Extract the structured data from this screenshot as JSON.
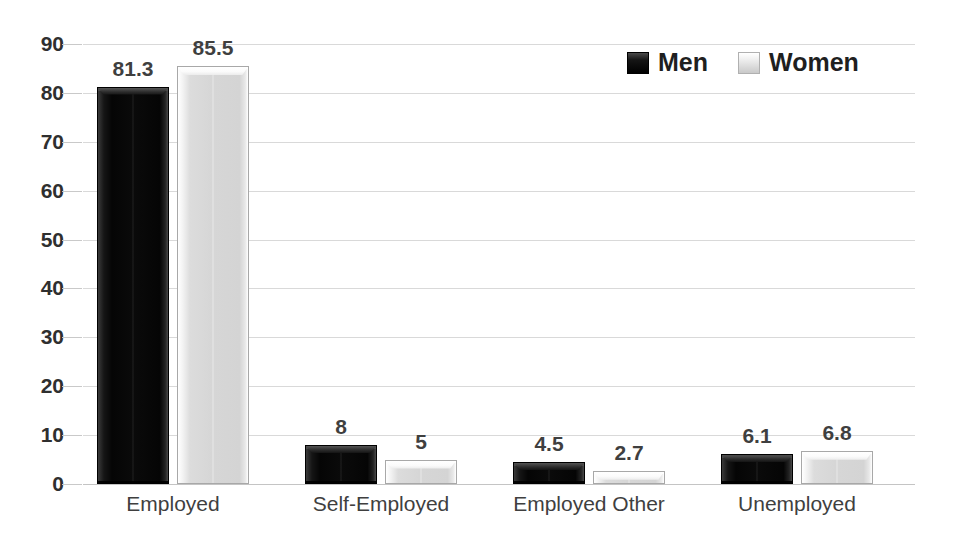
{
  "chart_data": {
    "type": "bar",
    "title": "",
    "subtitle": "",
    "xlabel": "",
    "ylabel": "",
    "categories": [
      "Employed",
      "Self-Employed",
      "Employed Other",
      "Unemployed"
    ],
    "series": [
      {
        "name": "Men",
        "color": "#000000",
        "values": [
          81.3,
          8,
          4.5,
          6.1
        ],
        "labels": [
          "81.3",
          "8",
          "4.5",
          "6.1"
        ]
      },
      {
        "name": "Women",
        "color": "#d9d9d9",
        "values": [
          85.5,
          5,
          2.7,
          6.8
        ],
        "labels": [
          "85.5",
          "5",
          "2.7",
          "6.8"
        ]
      }
    ],
    "ylim": [
      0,
      90
    ],
    "ytick_values": [
      0,
      10,
      20,
      30,
      40,
      50,
      60,
      70,
      80,
      90
    ],
    "ytick_labels": [
      "0",
      "10",
      "20",
      "30",
      "40",
      "50",
      "60",
      "70",
      "80",
      "90"
    ],
    "grid": true,
    "grid_axis": "y",
    "legend_position": "top-right",
    "data_labels_shown": true
  },
  "legend": {
    "entries": [
      {
        "label": "Men",
        "swatch": "men-legend-swatch"
      },
      {
        "label": "Women",
        "swatch": "women-legend-swatch"
      }
    ]
  },
  "colors": {
    "men_bar": "#0a0a0a",
    "women_bar": "#d9d9d9",
    "gridline": "#d9d9d9",
    "text": "#3f3f3f",
    "background": "#ffffff"
  }
}
